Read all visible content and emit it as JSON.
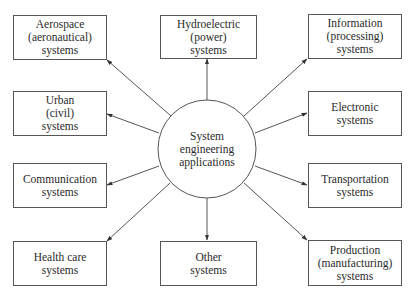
{
  "center": {
    "lines": [
      "System",
      "engineering",
      "applications"
    ]
  },
  "nodes": [
    {
      "id": "aerospace",
      "lines": [
        "Aerospace",
        "(aeronautical)",
        "systems"
      ]
    },
    {
      "id": "hydroelectric",
      "lines": [
        "Hydroelectric",
        "(power)",
        "systems"
      ]
    },
    {
      "id": "information",
      "lines": [
        "Information",
        "(processing)",
        "systems"
      ]
    },
    {
      "id": "urban",
      "lines": [
        "Urban",
        "(civil)",
        "systems"
      ]
    },
    {
      "id": "electronic",
      "lines": [
        "Electronic",
        "systems"
      ]
    },
    {
      "id": "communication",
      "lines": [
        "Communication",
        "systems"
      ]
    },
    {
      "id": "transportation",
      "lines": [
        "Transportation",
        "systems"
      ]
    },
    {
      "id": "health-care",
      "lines": [
        "Health care",
        "systems"
      ]
    },
    {
      "id": "other",
      "lines": [
        "Other",
        "systems"
      ]
    },
    {
      "id": "production",
      "lines": [
        "Production",
        "(manufacturing)",
        "systems"
      ]
    }
  ],
  "style": {
    "line_color": "#555555",
    "text_color": "#2a2a2a",
    "background": "#ffffff"
  }
}
